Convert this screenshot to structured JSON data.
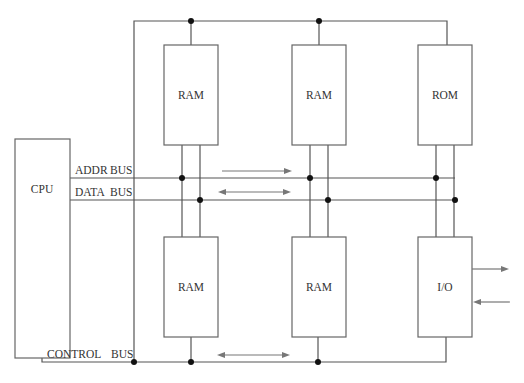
{
  "diagram": {
    "title": "",
    "blocks": {
      "cpu": {
        "label": "CPU"
      },
      "ram_top_1": {
        "label": "RAM"
      },
      "ram_top_2": {
        "label": "RAM"
      },
      "rom": {
        "label": "ROM"
      },
      "ram_bottom_1": {
        "label": "RAM"
      },
      "ram_bottom_2": {
        "label": "RAM"
      },
      "io": {
        "label": "I/O"
      }
    },
    "buses": {
      "addr": {
        "label_a": "ADDR",
        "label_b": "BUS"
      },
      "data": {
        "label_a": "DATA",
        "label_b": "BUS"
      },
      "control": {
        "label_a": "CONTROL",
        "label_b": "BUS"
      }
    },
    "arrows": {
      "addr_direction": "one-way-right",
      "data_direction": "two-way",
      "control_direction": "two-way",
      "io_out": "right",
      "io_in": "left"
    },
    "colors": {
      "line": "#555555",
      "box": "#666666",
      "dot": "#111111",
      "arrow": "#777777",
      "text": "#333333"
    }
  }
}
